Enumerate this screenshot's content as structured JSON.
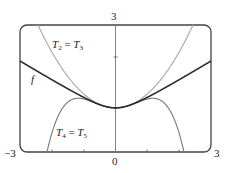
{
  "chart_data": {
    "type": "line",
    "title": "",
    "xlabel": "",
    "ylabel": "",
    "xlim": [
      -3,
      3
    ],
    "ylim": [
      -1,
      3
    ],
    "grid": false,
    "legend": "inline labels",
    "tick_labels": {
      "x_min": "−3",
      "x_max": "3",
      "x_zero": "0",
      "y_max": "3"
    },
    "series": [
      {
        "name": "f",
        "color": "#333333",
        "formula_estimate": "sqrt(0.152 + 0.37 x^2)",
        "x": [
          -3,
          -2,
          -1,
          0,
          1,
          2,
          3
        ],
        "y": [
          1.87,
          1.27,
          0.72,
          0.39,
          0.72,
          1.27,
          1.87
        ]
      },
      {
        "name": "T2 = T3",
        "color": "#aaaaaa",
        "formula_estimate": "0.39 + 0.44 x^2",
        "x": [
          -2.43,
          -2,
          -1,
          0,
          1,
          2,
          2.43
        ],
        "y": [
          3.0,
          2.15,
          0.83,
          0.39,
          0.83,
          2.15,
          3.0
        ]
      },
      {
        "name": "T4 = T5",
        "color": "#777777",
        "formula_estimate": "0.39 + 0.44 x^2 - 0.16 x^4",
        "x": [
          -2.15,
          -2,
          -1.17,
          0,
          1.17,
          2,
          2.15
        ],
        "y": [
          -1.0,
          -0.41,
          0.69,
          0.39,
          0.69,
          -0.41,
          -1.0
        ]
      }
    ]
  },
  "labels": {
    "f": "f",
    "t2_a": "T",
    "t2_a_sub": "2",
    "t2_eq": " = ",
    "t2_b": "T",
    "t2_b_sub": "3",
    "t4_a": "T",
    "t4_a_sub": "4",
    "t4_eq": " = ",
    "t4_b": "T",
    "t4_b_sub": "5",
    "x_min": "−3",
    "x_max": "3",
    "x_zero": "0",
    "y_max": "3"
  }
}
